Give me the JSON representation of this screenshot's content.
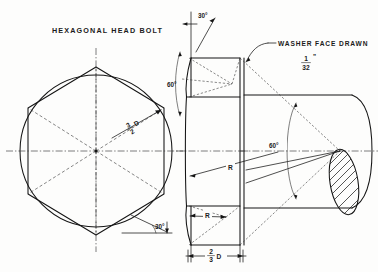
{
  "drawing": {
    "title": "HEXAGONAL HEAD BOLT",
    "subject": "hexagonal-head-bolt-construction",
    "sheet_bg": "#fdfdfc",
    "line_color": "#141414"
  },
  "labels": {
    "title": "HEXAGONAL HEAD BOLT",
    "washer_face": "WASHER FACE DRAWN",
    "washer_face_numer": "1",
    "washer_face_denom": "32",
    "washer_face_inch_mark": "\"",
    "across_flats_numer": "3",
    "across_flats_denom": "2",
    "across_flats_unit": "D",
    "head_height_numer": "2",
    "head_height_denom": "3",
    "head_height_unit": "D",
    "radius_upper": "R",
    "radius_lower": "R",
    "angle_top_view_30": "30°",
    "angle_chamfer_30": "30°",
    "angle_front_60": "60°",
    "angle_side_60": "60°"
  },
  "views": {
    "top_view": {
      "name": "hexagon-top-view",
      "caption": "HEXAGONAL HEAD BOLT",
      "center": [
        96,
        151
      ],
      "circle_radius": 76,
      "hexagon_orientation": "vertex-up",
      "radial_lines": 6,
      "dimension_label": "3/2 D",
      "chamfer_angle": "30°"
    },
    "front_view": {
      "name": "bolt-head-front-view",
      "left_face_x": 191,
      "right_face_x": 240,
      "head_width_label": "2/3 D",
      "angle_labels": [
        "30°",
        "60°"
      ],
      "radius_labels": [
        "R",
        "R"
      ]
    },
    "side_view": {
      "name": "bolt-shank-side-view",
      "shank_left_x": 240,
      "shank_right_x": 356,
      "section_end": "hatched-ellipse",
      "angle_label": "60°",
      "note": "WASHER FACE DRAWN 1/32\""
    }
  }
}
